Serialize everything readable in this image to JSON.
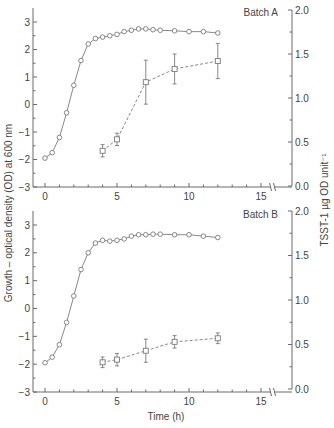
{
  "figure": {
    "ylabel_left": "Growth – optical density (OD) at 600 nm",
    "ylabel_right": "TSST-1 µg OD unit⁻¹",
    "xlabel": "Time (h)",
    "colors": {
      "axis": "#6b6b6b",
      "line": "#7a7a7a",
      "text": "#444444",
      "background": "#ffffff"
    }
  },
  "chart_data": [
    {
      "type": "line",
      "title": "Batch A",
      "xlabel": "Time (h)",
      "ylabel": "Growth – optical density (OD) at 600 nm",
      "ylabel_right": "TSST-1 µg OD unit⁻¹",
      "xlim": [
        0,
        16
      ],
      "xticks": [
        0,
        5,
        10,
        15
      ],
      "ylim": [
        -3,
        3
      ],
      "yticks": [
        -3,
        -2,
        -1,
        0,
        1,
        2,
        3
      ],
      "ylim_right": [
        0.0,
        2.0
      ],
      "yticks_right": [
        "0.0",
        "0.5",
        "1.0",
        "1.5",
        "2.0"
      ],
      "grid": false,
      "series": [
        {
          "name": "Growth (OD600, log scale)",
          "axis": "left",
          "marker": "circle",
          "linestyle": "solid",
          "x": [
            0,
            0.5,
            1,
            1.5,
            2,
            2.5,
            3,
            3.5,
            4,
            4.5,
            5,
            5.5,
            6,
            6.5,
            7,
            7.5,
            8,
            9,
            10,
            11,
            12
          ],
          "y": [
            -1.95,
            -1.75,
            -1.2,
            -0.3,
            0.7,
            1.6,
            2.2,
            2.4,
            2.45,
            2.5,
            2.55,
            2.65,
            2.7,
            2.75,
            2.75,
            2.72,
            2.7,
            2.68,
            2.65,
            2.65,
            2.6
          ]
        },
        {
          "name": "TSST-1 (µg per OD unit)",
          "axis": "right",
          "marker": "square",
          "linestyle": "dashed",
          "x": [
            4,
            5,
            7,
            9,
            12
          ],
          "y": [
            0.4,
            0.53,
            1.18,
            1.33,
            1.42
          ],
          "error": [
            0.07,
            0.07,
            0.25,
            0.17,
            0.2
          ]
        }
      ]
    },
    {
      "type": "line",
      "title": "Batch B",
      "xlabel": "Time (h)",
      "ylabel": "Growth – optical density (OD) at 600 nm",
      "ylabel_right": "TSST-1 µg OD unit⁻¹",
      "xlim": [
        0,
        16
      ],
      "xticks": [
        0,
        5,
        10,
        15
      ],
      "ylim": [
        -3,
        3
      ],
      "yticks": [
        -3,
        -2,
        -1,
        0,
        1,
        2,
        3
      ],
      "ylim_right": [
        0.0,
        2.0
      ],
      "yticks_right": [
        "0.0",
        "0.5",
        "1.0",
        "1.5",
        "2.0"
      ],
      "grid": false,
      "series": [
        {
          "name": "Growth (OD600, log scale)",
          "axis": "left",
          "marker": "circle",
          "linestyle": "solid",
          "x": [
            0,
            0.5,
            1,
            1.5,
            2,
            2.5,
            3,
            3.5,
            4,
            4.5,
            5,
            5.5,
            6,
            6.5,
            7,
            7.5,
            8,
            9,
            10,
            11,
            12
          ],
          "y": [
            -1.95,
            -1.75,
            -1.3,
            -0.5,
            0.45,
            1.4,
            2.0,
            2.35,
            2.45,
            2.42,
            2.45,
            2.5,
            2.6,
            2.65,
            2.65,
            2.67,
            2.67,
            2.65,
            2.65,
            2.6,
            2.55
          ]
        },
        {
          "name": "TSST-1 (µg per OD unit)",
          "axis": "right",
          "marker": "square",
          "linestyle": "dashed",
          "x": [
            4,
            5,
            7,
            9,
            12
          ],
          "y": [
            0.3,
            0.33,
            0.43,
            0.53,
            0.57
          ],
          "error": [
            0.06,
            0.07,
            0.13,
            0.07,
            0.06
          ]
        }
      ]
    }
  ]
}
